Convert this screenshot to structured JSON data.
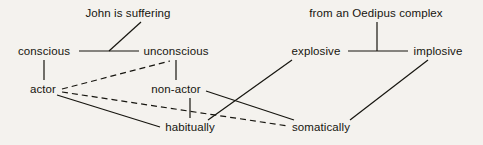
{
  "diagram": {
    "type": "tree-lattice",
    "background_color": "#f4f2ee",
    "line_color": "#16150f",
    "nodes": [
      {
        "id": "john-is-suffering",
        "label": "John is suffering",
        "x": 128,
        "y": 13,
        "group": "left",
        "level": 0
      },
      {
        "id": "from-an-oedipus-complex",
        "label": "from an Oedipus complex",
        "x": 376,
        "y": 13,
        "group": "right",
        "level": 0
      },
      {
        "id": "conscious",
        "label": "conscious",
        "x": 44,
        "y": 51,
        "group": "left",
        "level": 1
      },
      {
        "id": "unconscious",
        "label": "unconscious",
        "x": 176,
        "y": 51,
        "group": "left",
        "level": 1
      },
      {
        "id": "explosive",
        "label": "explosive",
        "x": 316,
        "y": 51,
        "group": "right",
        "level": 1
      },
      {
        "id": "implosive",
        "label": "implosive",
        "x": 438,
        "y": 51,
        "group": "right",
        "level": 1
      },
      {
        "id": "actor",
        "label": "actor",
        "x": 43,
        "y": 89,
        "group": "left",
        "level": 2
      },
      {
        "id": "non-actor",
        "label": "non-actor",
        "x": 176,
        "y": 89,
        "group": "left",
        "level": 2
      },
      {
        "id": "habitually",
        "label": "habitually",
        "x": 190,
        "y": 127,
        "group": "left",
        "level": 3
      },
      {
        "id": "somatically",
        "label": "somatically",
        "x": 321,
        "y": 127,
        "group": "right",
        "level": 3
      }
    ],
    "edges": [
      {
        "id": "conscious-unconscious",
        "from": "conscious",
        "to": "unconscious",
        "style": "solid"
      },
      {
        "id": "suffering-to-axis",
        "from": "john-is-suffering",
        "to": "conscious-unconscious-axis",
        "style": "solid"
      },
      {
        "id": "explosive-implosive",
        "from": "explosive",
        "to": "implosive",
        "style": "solid"
      },
      {
        "id": "oedipus-to-axis",
        "from": "from-an-oedipus-complex",
        "to": "explosive-implosive-axis",
        "style": "solid"
      },
      {
        "id": "conscious-actor",
        "from": "conscious",
        "to": "actor",
        "style": "solid"
      },
      {
        "id": "unconscious-nonactor",
        "from": "unconscious",
        "to": "non-actor",
        "style": "solid"
      },
      {
        "id": "nonactor-habitually",
        "from": "non-actor",
        "to": "habitually",
        "style": "solid"
      },
      {
        "id": "actor-unconscious",
        "from": "actor",
        "to": "unconscious",
        "style": "dashed"
      },
      {
        "id": "actor-somatically",
        "from": "actor",
        "to": "somatically",
        "style": "dashed"
      },
      {
        "id": "actor-habitually",
        "from": "actor",
        "to": "habitually",
        "style": "solid"
      },
      {
        "id": "explosive-habitually",
        "from": "explosive",
        "to": "habitually",
        "style": "solid"
      },
      {
        "id": "nonactor-somatically",
        "from": "non-actor",
        "to": "somatically",
        "style": "solid"
      },
      {
        "id": "implosive-somatically",
        "from": "implosive",
        "to": "somatically",
        "style": "solid"
      }
    ]
  }
}
